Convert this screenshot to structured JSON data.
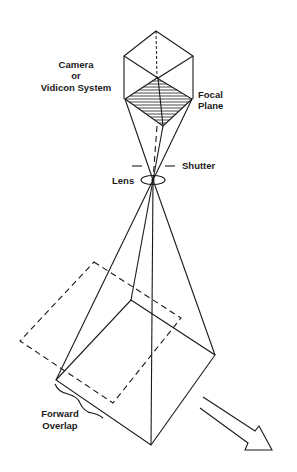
{
  "diagram": {
    "labels": {
      "camera_line1": "Camera",
      "camera_line2": "or",
      "camera_line3": "Vidicon System",
      "focal_line1": "Focal",
      "focal_line2": "Plane",
      "shutter": "Shutter",
      "lens": "Lens",
      "overlap_line1": "Forward",
      "overlap_line2": "Overlap"
    },
    "icons": {
      "direction_arrow": "flight-direction-arrow-icon"
    },
    "colors": {
      "line": "#1a1a1a",
      "background": "#ffffff"
    }
  }
}
